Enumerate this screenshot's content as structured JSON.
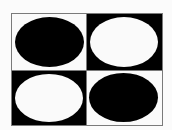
{
  "figure": {
    "colors": {
      "black": "#000000",
      "white": "#fafafa",
      "border": "#7a7a7a",
      "page_background": "#fbfbfb"
    },
    "cells": [
      {
        "position": "top-left",
        "background": "#fafafa",
        "ellipse_color": "#000000"
      },
      {
        "position": "top-right",
        "background": "#000000",
        "ellipse_color": "#fafafa"
      },
      {
        "position": "bottom-left",
        "background": "#000000",
        "ellipse_color": "#fafafa"
      },
      {
        "position": "bottom-right",
        "background": "#fafafa",
        "ellipse_color": "#000000"
      }
    ]
  }
}
